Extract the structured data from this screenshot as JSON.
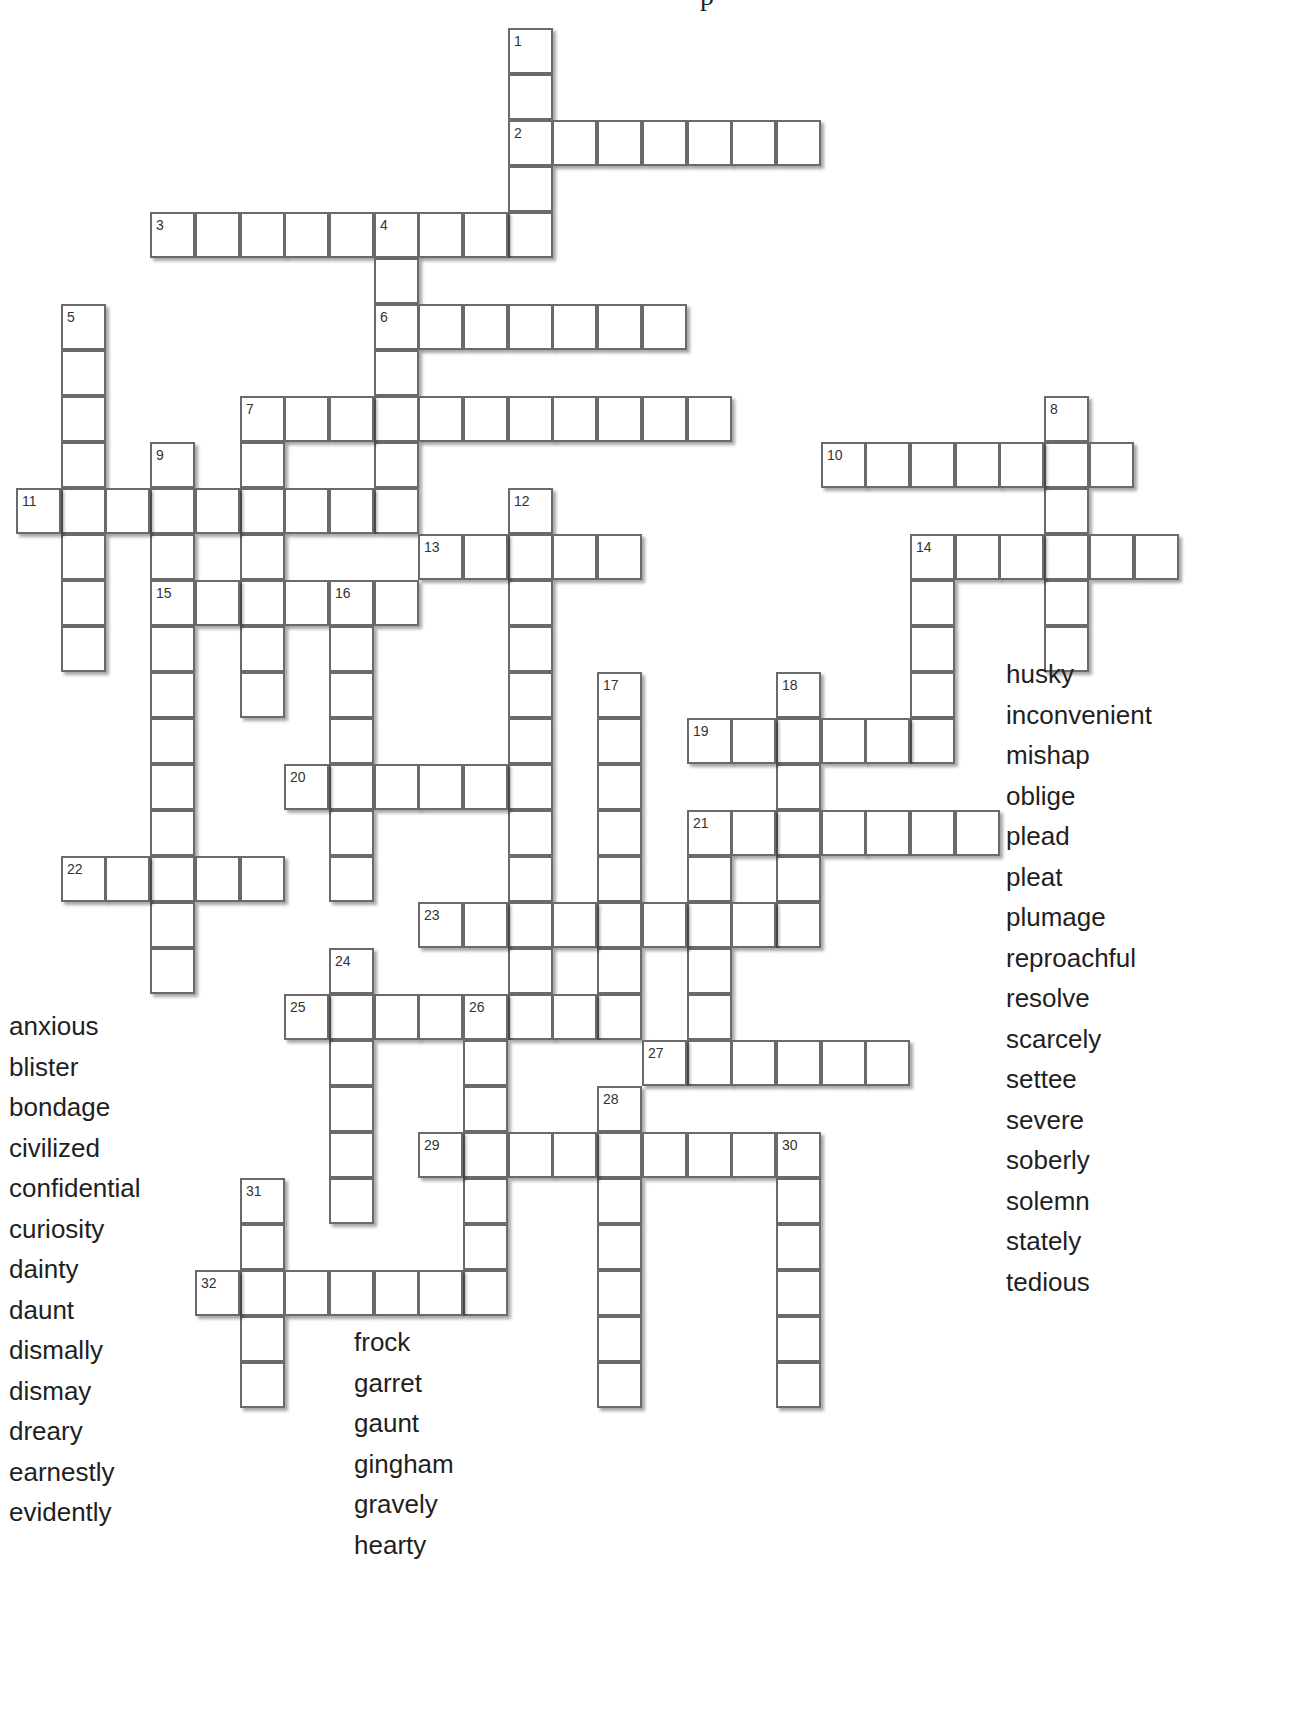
{
  "title_fragment": "p",
  "layout": {
    "origin_x": 16,
    "origin_y": 28,
    "pitch_x": 44.7,
    "pitch_y": 46
  },
  "entries": [
    {
      "number": 1,
      "dir": "down",
      "col": 11,
      "row": 0,
      "length": 5
    },
    {
      "number": 2,
      "dir": "across",
      "col": 11,
      "row": 2,
      "length": 7
    },
    {
      "number": 3,
      "dir": "across",
      "col": 3,
      "row": 4,
      "length": 9
    },
    {
      "number": 4,
      "dir": "down",
      "col": 8,
      "row": 4,
      "length": 7
    },
    {
      "number": 5,
      "dir": "down",
      "col": 1,
      "row": 6,
      "length": 8
    },
    {
      "number": 6,
      "dir": "across",
      "col": 8,
      "row": 6,
      "length": 7
    },
    {
      "number": 7,
      "dir": "across",
      "col": 5,
      "row": 8,
      "length": 11
    },
    {
      "number": 7,
      "dir": "down",
      "col": 5,
      "row": 8,
      "length": 7
    },
    {
      "number": 8,
      "dir": "down",
      "col": 23,
      "row": 8,
      "length": 6
    },
    {
      "number": 9,
      "dir": "down",
      "col": 3,
      "row": 9,
      "length": 12
    },
    {
      "number": 10,
      "dir": "across",
      "col": 18,
      "row": 9,
      "length": 7
    },
    {
      "number": 11,
      "dir": "across",
      "col": 0,
      "row": 10,
      "length": 9
    },
    {
      "number": 12,
      "dir": "down",
      "col": 11,
      "row": 10,
      "length": 12
    },
    {
      "number": 13,
      "dir": "across",
      "col": 9,
      "row": 11,
      "length": 5
    },
    {
      "number": 14,
      "dir": "across",
      "col": 20,
      "row": 11,
      "length": 6
    },
    {
      "number": 14,
      "dir": "down",
      "col": 20,
      "row": 11,
      "length": 5
    },
    {
      "number": 15,
      "dir": "across",
      "col": 3,
      "row": 12,
      "length": 6
    },
    {
      "number": 16,
      "dir": "down",
      "col": 7,
      "row": 12,
      "length": 7
    },
    {
      "number": 17,
      "dir": "down",
      "col": 13,
      "row": 14,
      "length": 8
    },
    {
      "number": 18,
      "dir": "down",
      "col": 17,
      "row": 14,
      "length": 6
    },
    {
      "number": 19,
      "dir": "across",
      "col": 15,
      "row": 15,
      "length": 6
    },
    {
      "number": 20,
      "dir": "across",
      "col": 6,
      "row": 16,
      "length": 6
    },
    {
      "number": 21,
      "dir": "across",
      "col": 15,
      "row": 17,
      "length": 7
    },
    {
      "number": 21,
      "dir": "down",
      "col": 15,
      "row": 17,
      "length": 6
    },
    {
      "number": 22,
      "dir": "across",
      "col": 1,
      "row": 18,
      "length": 5
    },
    {
      "number": 23,
      "dir": "across",
      "col": 9,
      "row": 19,
      "length": 9
    },
    {
      "number": 24,
      "dir": "down",
      "col": 7,
      "row": 20,
      "length": 6
    },
    {
      "number": 25,
      "dir": "across",
      "col": 6,
      "row": 21,
      "length": 8
    },
    {
      "number": 26,
      "dir": "down",
      "col": 10,
      "row": 21,
      "length": 7
    },
    {
      "number": 27,
      "dir": "across",
      "col": 14,
      "row": 22,
      "length": 6
    },
    {
      "number": 28,
      "dir": "down",
      "col": 13,
      "row": 23,
      "length": 7
    },
    {
      "number": 29,
      "dir": "across",
      "col": 9,
      "row": 24,
      "length": 9
    },
    {
      "number": 30,
      "dir": "down",
      "col": 17,
      "row": 24,
      "length": 6
    },
    {
      "number": 31,
      "dir": "down",
      "col": 5,
      "row": 25,
      "length": 5
    },
    {
      "number": 32,
      "dir": "across",
      "col": 4,
      "row": 27,
      "length": 7
    }
  ],
  "word_bank": {
    "left": [
      "anxious",
      "blister",
      "bondage",
      "civilized",
      "confidential",
      "curiosity",
      "dainty",
      "daunt",
      "dismally",
      "dismay",
      "dreary",
      "earnestly",
      "evidently"
    ],
    "middle": [
      "frock",
      "garret",
      "gaunt",
      "gingham",
      "gravely",
      "hearty"
    ],
    "right": [
      "husky",
      "inconvenient",
      "mishap",
      "oblige",
      "plead",
      "pleat",
      "plumage",
      "reproachful",
      "resolve",
      "scarcely",
      "settee",
      "severe",
      "soberly",
      "solemn",
      "stately",
      "tedious"
    ]
  }
}
